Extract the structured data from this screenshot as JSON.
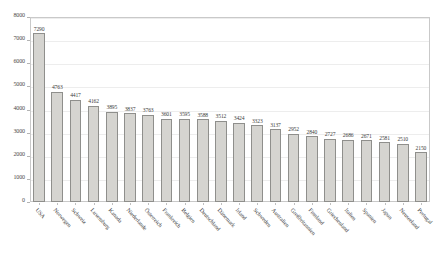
{
  "chart_data": {
    "type": "bar",
    "title": "",
    "subtitle": "",
    "xlabel": "",
    "ylabel": "",
    "ylim": [
      0,
      8000
    ],
    "ytick_step": 1000,
    "grid": true,
    "legend": false,
    "orientation": "vertical",
    "bar_color": "#d5d4d0",
    "bar_border_color": "#8f8f8c",
    "categories": [
      "USA",
      "Norwegen",
      "Schweiz",
      "Luxemburg",
      "Kanada",
      "Niederlande",
      "Österreich",
      "Frankreich",
      "Belgien",
      "Deutschland",
      "Dänemark",
      "Irland",
      "Schweden",
      "Australien",
      "Großbritannien",
      "Finnland",
      "Griechenland",
      "Italien",
      "Spanien",
      "Japan",
      "Neuseeland",
      "Portugal"
    ],
    "values": [
      7290,
      4763,
      4417,
      4162,
      3895,
      3837,
      3763,
      3601,
      3595,
      3588,
      3512,
      3424,
      3323,
      3137,
      2952,
      2840,
      2727,
      2686,
      2671,
      2581,
      2510,
      2150
    ],
    "ytick_labels": [
      "0",
      "1000",
      "2000",
      "3000",
      "4000",
      "5000",
      "6000",
      "7000",
      "8000"
    ]
  }
}
